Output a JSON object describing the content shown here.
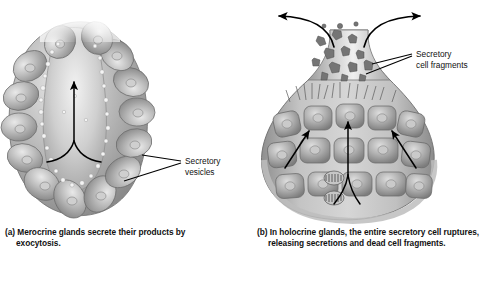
{
  "figure": {
    "background_color": "#ffffff",
    "ink_color": "#000000",
    "tissue_color_light": "#e0e0e0",
    "tissue_color_mid": "#9a9a9a",
    "tissue_color_dark": "#6a6a6a"
  },
  "panel_a": {
    "id": "a",
    "marker": "(a)",
    "caption_line1": "Merocrine glands secrete their",
    "caption_line2": "products by exocytosis.",
    "caption_full": "(a) Merocrine glands secrete their products by exocytosis.",
    "gland_type": "merocrine",
    "label": {
      "name": "secretory-vesicles",
      "line1": "Secretory",
      "line2": "vesicles"
    },
    "arrows": {
      "count": 1,
      "description": "Y-shaped arrow pointing up through central lumen toward duct"
    },
    "structures": [
      "lobular secretory cells",
      "central lumen",
      "secretory vesicles",
      "duct opening"
    ]
  },
  "panel_b": {
    "id": "b",
    "marker": "(b)",
    "caption_line1": "In holocrine glands, the entire secretory",
    "caption_line2": "cell ruptures, releasing secretions and",
    "caption_line3": "dead cell fragments.",
    "caption_full": "(b) In holocrine glands, the entire secretory cell ruptures, releasing secretions and dead cell fragments.",
    "gland_type": "holocrine",
    "label": {
      "name": "secretory-cell-fragments",
      "line1": "Secretory",
      "line2": "cell fragments"
    },
    "arrows": {
      "outflow_left": "curved arrow pointing left out of duct neck",
      "outflow_right": "curved arrow pointing right out of duct neck",
      "internal_count": 4,
      "description": "arrows showing cells migrating upward and rupturing"
    },
    "structures": [
      "flask-shaped gland body",
      "duct neck",
      "ruptured cells",
      "cell fragments",
      "dividing stem cells at base",
      "basement membrane"
    ]
  }
}
